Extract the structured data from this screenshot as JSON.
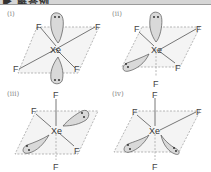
{
  "header": {
    "title": "▶ 解答例"
  },
  "colors": {
    "lobe_fill": "#d9d9d9",
    "lobe_stroke": "#555555",
    "bond": "#555555",
    "dashed_plane": "#9a9a9a",
    "plane_fill": "#f2f2f2",
    "label": "#888888"
  },
  "panels": [
    {
      "label": "(i)",
      "center": "Xe",
      "ligands": [
        "F",
        "F",
        "F",
        "F"
      ],
      "lone_pairs": 2,
      "arrangement": "lone pairs axial (up/down), 4 F in equatorial plane"
    },
    {
      "label": "(ii)",
      "center": "Xe",
      "ligands": [
        "F",
        "F",
        "F",
        "F"
      ],
      "lone_pairs": 2,
      "arrangement": "lone pair axial up + lone pair equatorial, 3 F equatorial + 1 F axial down"
    },
    {
      "label": "(iii)",
      "center": "Xe",
      "ligands": [
        "F",
        "F",
        "F",
        "F"
      ],
      "lone_pairs": 2,
      "arrangement": "2 lone pairs equatorial (opposite), 2 F axial + 2 F equatorial"
    },
    {
      "label": "(iv)",
      "center": "Xe",
      "ligands": [
        "F",
        "F",
        "F",
        "F"
      ],
      "lone_pairs": 2,
      "arrangement": "2 lone pairs equatorial (adjacent), 2 F axial + 2 F equatorial"
    }
  ]
}
